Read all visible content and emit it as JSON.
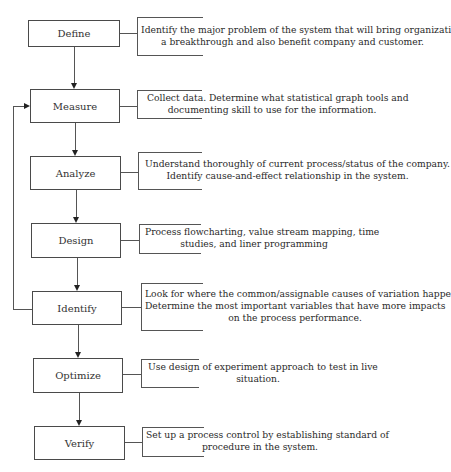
{
  "diagram": {
    "type": "process-flowchart",
    "steps": [
      {
        "label": "Define",
        "description": [
          "Identify the major problem of the system that will bring organization",
          "a breakthrough and also benefit company and customer."
        ]
      },
      {
        "label": "Measure",
        "description": [
          "Collect data. Determine what statistical graph tools and",
          "documenting skill to use for the information."
        ]
      },
      {
        "label": "Analyze",
        "description": [
          "Understand thoroughly of current process/status of the company.",
          "Identify cause-and-effect relationship in the system."
        ]
      },
      {
        "label": "Design",
        "description": [
          "Process flowcharting, value stream mapping, time",
          "studies, and liner programming"
        ]
      },
      {
        "label": "Identify",
        "description": [
          "Look for where the common/assignable causes of variation happen.",
          "Determine the most important variables that have more impacts",
          "on the process performance."
        ]
      },
      {
        "label": "Optimize",
        "description": [
          "Use design of experiment approach to test in live",
          "situation."
        ]
      },
      {
        "label": "Verify",
        "description": [
          "Set up a process control by establishing standard of",
          "procedure in the system."
        ]
      }
    ],
    "feedback_loop": {
      "from": "Identify",
      "to": "Measure"
    },
    "colors": {
      "line": "#555555",
      "arrow": "#222222",
      "text": "#2a2a2a",
      "background": "#ffffff"
    }
  }
}
